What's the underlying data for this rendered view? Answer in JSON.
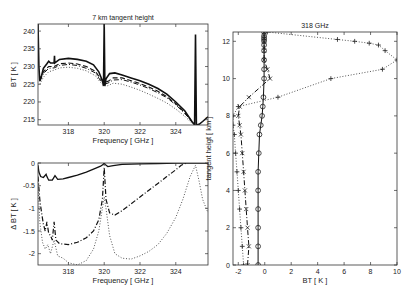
{
  "chart_data": [
    {
      "id": "top-left",
      "type": "line",
      "title": "7 km tangent height",
      "xlabel": "Frequency [ GHz ]",
      "ylabel": "BT [ K ]",
      "xlim": [
        316.3,
        325.8
      ],
      "ylim": [
        213.5,
        242
      ],
      "xticks": [
        318,
        320,
        322,
        324
      ],
      "yticks": [
        215,
        220,
        225,
        230,
        235,
        240
      ],
      "box": {
        "x0": 38,
        "y0": 24,
        "x1": 208,
        "y1": 125
      },
      "series": [
        {
          "name": "solid",
          "style": "solid",
          "width": 1.6,
          "x": [
            316.3,
            316.35,
            316.4,
            316.5,
            316.6,
            316.8,
            316.9,
            317.0,
            317.2,
            317.22,
            317.24,
            317.5,
            318,
            318.5,
            319,
            319.4,
            319.7,
            319.9,
            319.96,
            320,
            320.04,
            320.1,
            320.3,
            320.6,
            321,
            321.5,
            322,
            322.5,
            323,
            323.5,
            324,
            324.5,
            324.9,
            325.05,
            325.1,
            325.15,
            325.3,
            325.5,
            325.8
          ],
          "y": [
            242,
            230,
            226,
            227.5,
            229.5,
            230.8,
            231.5,
            231,
            231,
            233,
            231,
            232,
            232.3,
            232,
            231.5,
            230.5,
            228.5,
            226,
            224.5,
            242,
            224.5,
            226.5,
            228,
            228.2,
            227.6,
            226.8,
            226,
            225,
            223.8,
            222.2,
            220,
            217.5,
            214.5,
            213.5,
            239,
            213.5,
            213.7,
            214.5,
            215.8
          ]
        },
        {
          "name": "dashed",
          "style": "dashed",
          "width": 1.1,
          "x": [
            316.4,
            316.6,
            316.9,
            317.2,
            317.5,
            318,
            318.5,
            319,
            319.5,
            319.8,
            320,
            320.2,
            320.5,
            321,
            321.5,
            322,
            322.5,
            323,
            323.5,
            324,
            324.5,
            324.9
          ],
          "y": [
            226,
            228.5,
            230,
            230,
            230.8,
            231,
            230.7,
            230,
            228.7,
            226.5,
            225.5,
            225.8,
            226.8,
            226.8,
            226,
            225.2,
            224.2,
            223,
            221.5,
            219.5,
            217,
            214.5
          ]
        },
        {
          "name": "dashdot",
          "style": "dashdot",
          "width": 1.0,
          "x": [
            316.4,
            316.6,
            316.9,
            317.2,
            317.5,
            318,
            318.5,
            319,
            319.5,
            319.8,
            320,
            320.2,
            320.5,
            321,
            321.5,
            322,
            322.5,
            323,
            323.5,
            324,
            324.5,
            324.9
          ],
          "y": [
            225.8,
            228,
            229.5,
            229.6,
            230.3,
            230.6,
            230.3,
            229.5,
            228.2,
            226,
            225,
            225.3,
            226.2,
            226.3,
            225.6,
            224.8,
            223.8,
            222.6,
            221.2,
            219.2,
            216.8,
            214.5
          ]
        },
        {
          "name": "dotted",
          "style": "dotted",
          "width": 1.0,
          "x": [
            316.4,
            316.6,
            316.9,
            317.2,
            317.5,
            318,
            318.5,
            319,
            319.5,
            319.8,
            320,
            320.2,
            320.5,
            321,
            321.5,
            322,
            322.5,
            323,
            323.5,
            324,
            324.5,
            324.9
          ],
          "y": [
            225,
            227,
            228.5,
            229,
            229.6,
            229.8,
            229.5,
            228.8,
            227.4,
            225.5,
            224.5,
            224.6,
            225.3,
            225,
            224.2,
            223.3,
            222.2,
            221,
            219.7,
            218,
            216,
            214
          ]
        }
      ]
    },
    {
      "id": "bottom-left",
      "type": "line",
      "title": "",
      "xlabel": "Frequency [ GHz ]",
      "ylabel": "Δ BT [ K ]",
      "xlim": [
        316.3,
        325.8
      ],
      "ylim": [
        -2.25,
        0
      ],
      "xticks": [
        318,
        320,
        322,
        324
      ],
      "yticks": [
        0,
        -0.5,
        -1,
        -1.5,
        -2
      ],
      "yticklabels": [
        "0",
        "-0.5",
        "-1",
        "-1.5",
        "-2"
      ],
      "box": {
        "x0": 38,
        "y0": 163,
        "x1": 208,
        "y1": 265
      },
      "series": [
        {
          "name": "solid",
          "style": "solid",
          "width": 1.3,
          "x": [
            316.3,
            316.35,
            316.45,
            316.6,
            316.75,
            316.8,
            316.9,
            317.1,
            317.25,
            317.4,
            317.7,
            318,
            318.5,
            319,
            319.5,
            319.8,
            319.95,
            320,
            320.05,
            320.2,
            320.5,
            321,
            322,
            323,
            324,
            325,
            325.8
          ],
          "y": [
            -0.05,
            -0.2,
            -0.3,
            -0.32,
            -0.25,
            -0.3,
            -0.38,
            -0.38,
            -0.28,
            -0.36,
            -0.35,
            -0.32,
            -0.27,
            -0.2,
            -0.12,
            -0.07,
            -0.03,
            0,
            -0.03,
            -0.08,
            -0.06,
            -0.03,
            -0.02,
            -0.01,
            0,
            0,
            0
          ]
        },
        {
          "name": "dashdot",
          "style": "dashdot",
          "width": 1.2,
          "x": [
            316.3,
            316.4,
            316.5,
            316.6,
            316.7,
            316.8,
            316.9,
            317.0,
            317.1,
            317.2,
            317.3,
            317.5,
            318,
            318.5,
            319,
            319.4,
            319.7,
            319.9,
            320,
            320.1,
            320.3,
            320.6,
            321,
            321.5,
            322,
            322.5,
            323,
            323.5,
            324,
            324.3,
            324.6
          ],
          "y": [
            -0.3,
            -0.8,
            -1.1,
            -1.35,
            -1.5,
            -1.3,
            -1.55,
            -1.6,
            -1.7,
            -1.3,
            -1.7,
            -1.78,
            -1.8,
            -1.75,
            -1.65,
            -1.5,
            -1.25,
            -0.8,
            -0.1,
            -0.8,
            -1.1,
            -1.15,
            -1.05,
            -0.9,
            -0.75,
            -0.6,
            -0.45,
            -0.3,
            -0.15,
            -0.05,
            0
          ]
        },
        {
          "name": "dotted",
          "style": "dotted",
          "width": 1.0,
          "x": [
            316.3,
            316.4,
            316.55,
            316.7,
            316.85,
            317.0,
            317.2,
            317.4,
            317.7,
            318,
            318.5,
            319,
            319.4,
            319.7,
            319.9,
            320,
            320.1,
            320.3,
            320.6,
            321,
            321.5,
            322,
            322.5,
            323,
            323.5,
            324,
            324.4,
            324.8,
            325.1,
            325.3,
            325.5,
            325.8
          ],
          "y": [
            -0.4,
            -1.3,
            -1.75,
            -1.9,
            -1.8,
            -2.0,
            -1.7,
            -2.05,
            -2.1,
            -2.2,
            -2.25,
            -2.15,
            -1.9,
            -1.5,
            -1.0,
            -0.75,
            -1.0,
            -1.6,
            -2.0,
            -2.1,
            -2.12,
            -2.05,
            -1.95,
            -1.8,
            -1.55,
            -1.2,
            -0.8,
            -0.3,
            -0.05,
            -0.4,
            -0.8,
            -1.1
          ]
        }
      ]
    },
    {
      "id": "right",
      "type": "line",
      "title": "318 GHz",
      "xlabel": "BT [ K ]",
      "ylabel": "tangent heigt [ km ]",
      "xlim": [
        -2.4,
        10
      ],
      "ylim": [
        0,
        12.5
      ],
      "xticks": [
        -2,
        0,
        2,
        4,
        6,
        8,
        10
      ],
      "yticks": [
        0,
        2,
        4,
        6,
        8,
        10,
        12
      ],
      "box": {
        "x0": 233,
        "y0": 32,
        "x1": 397,
        "y1": 265
      },
      "series": [
        {
          "name": "solid-o",
          "style": "solid",
          "marker": "o",
          "width": 1.0,
          "x": [
            -0.5,
            -0.5,
            -0.5,
            -0.5,
            -0.5,
            -0.5,
            -0.45,
            -0.4,
            -0.3,
            -0.2,
            -0.15,
            -0.1,
            -0.05,
            -0.05,
            -0.05,
            -0.05,
            -0.05,
            -0.05,
            -0.05,
            -0.05,
            -0.05,
            -0.05
          ],
          "y": [
            0,
            1,
            2,
            3,
            4,
            5,
            6,
            7,
            7.5,
            8,
            8.5,
            9,
            10,
            10.5,
            11,
            11.5,
            11.8,
            12,
            12.1,
            12.2,
            12.3,
            12.5
          ]
        },
        {
          "name": "dashdot-x",
          "style": "dashdot",
          "marker": "x",
          "width": 1.0,
          "x": [
            -1.3,
            -1.2,
            -1.3,
            -1.4,
            -1.5,
            -1.6,
            -1.7,
            -1.8,
            -1.9,
            -2.0,
            -1.9,
            -1.2,
            0.4,
            0.2,
            -0.05,
            -0.05,
            -0.05,
            -0.05
          ],
          "y": [
            0,
            1,
            2,
            3,
            4,
            5,
            6,
            7,
            7.5,
            8,
            8.5,
            9,
            10,
            10.5,
            11,
            11.5,
            12,
            12.5
          ]
        },
        {
          "name": "dotted-plus",
          "style": "dotted",
          "marker": "+",
          "width": 1.0,
          "x": [
            -1.6,
            -1.7,
            -1.8,
            -1.9,
            -2.0,
            -2.1,
            -2.2,
            -2.3,
            -2.4,
            -2.4,
            -2.0,
            1.0,
            5.0,
            8.9,
            10,
            9.1,
            8.6,
            7.9,
            6.8,
            5.5,
            0.2
          ],
          "y": [
            0,
            1,
            2,
            3,
            4,
            5,
            6,
            7,
            7.5,
            8,
            8.5,
            9,
            10,
            10.5,
            11,
            11.5,
            11.8,
            11.9,
            12.0,
            12.1,
            12.5
          ]
        }
      ]
    }
  ]
}
